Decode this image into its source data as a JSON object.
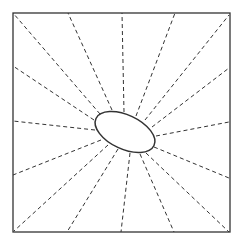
{
  "diagram": {
    "stroke_color": "#333333",
    "background": "#ffffff",
    "frame": {
      "x": 13,
      "y": 13,
      "width": 217,
      "height": 219
    },
    "ellipse": {
      "cx": 125,
      "cy": 132,
      "rx": 32,
      "ry": 17,
      "rotation_deg": 25
    },
    "rays": [
      {
        "x1": 100,
        "y1": 114,
        "x2": 13,
        "y2": 13
      },
      {
        "x1": 112,
        "y1": 110,
        "x2": 68,
        "y2": 13
      },
      {
        "x1": 124,
        "y1": 112,
        "x2": 122,
        "y2": 13
      },
      {
        "x1": 136,
        "y1": 116,
        "x2": 175,
        "y2": 13
      },
      {
        "x1": 145,
        "y1": 120,
        "x2": 229,
        "y2": 15
      },
      {
        "x1": 152,
        "y1": 127,
        "x2": 229,
        "y2": 68
      },
      {
        "x1": 156,
        "y1": 136,
        "x2": 229,
        "y2": 122
      },
      {
        "x1": 154,
        "y1": 147,
        "x2": 229,
        "y2": 178
      },
      {
        "x1": 146,
        "y1": 153,
        "x2": 229,
        "y2": 232
      },
      {
        "x1": 140,
        "y1": 154,
        "x2": 174,
        "y2": 232
      },
      {
        "x1": 130,
        "y1": 153,
        "x2": 121,
        "y2": 232
      },
      {
        "x1": 118,
        "y1": 149,
        "x2": 67,
        "y2": 232
      },
      {
        "x1": 108,
        "y1": 145,
        "x2": 14,
        "y2": 231
      },
      {
        "x1": 101,
        "y1": 140,
        "x2": 13,
        "y2": 175
      },
      {
        "x1": 95,
        "y1": 130,
        "x2": 13,
        "y2": 121
      },
      {
        "x1": 94,
        "y1": 120,
        "x2": 13,
        "y2": 66
      }
    ]
  }
}
